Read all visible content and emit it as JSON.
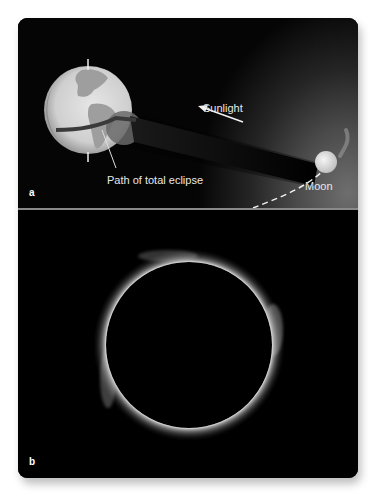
{
  "figure": {
    "panel_a": {
      "letter": "a",
      "labels": {
        "sunlight": "Sunlight",
        "path": "Path of total eclipse",
        "moon": "Moon"
      },
      "objects": {
        "earth": "earth-globe",
        "moon": "moon-sphere",
        "shadow": "umbra-shadow-cone",
        "orbit": "moon-orbit-dashed",
        "arrow": "sunlight-arrow"
      }
    },
    "panel_b": {
      "letter": "b",
      "subject": "total-solar-eclipse-corona"
    },
    "colors": {
      "background": "#000000",
      "label": "#e8e8e8",
      "divider": "#8a8a8a"
    }
  }
}
